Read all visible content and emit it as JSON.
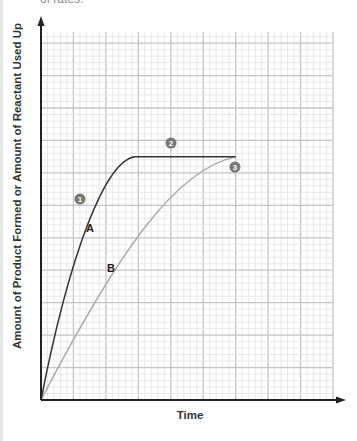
{
  "page": {
    "top_fragment": "of rates."
  },
  "chart_data": {
    "type": "line",
    "title": "",
    "xlabel": "Time",
    "ylabel": "Amount of Product Formed or Amount of Reactant Used Up",
    "grid": true,
    "x_range": [
      0,
      9
    ],
    "y_range": [
      0,
      11.5
    ],
    "series": [
      {
        "name": "A",
        "color": "#333333",
        "points": [
          [
            0,
            0
          ],
          [
            1,
            3.6
          ],
          [
            2,
            6.4
          ],
          [
            3,
            7.5
          ],
          [
            6,
            7.5
          ]
        ]
      },
      {
        "name": "B",
        "color": "#aaaaaa",
        "points": [
          [
            0,
            0
          ],
          [
            2,
            4.1
          ],
          [
            4,
            6.7
          ],
          [
            6,
            7.5
          ]
        ]
      }
    ],
    "annotations": [
      {
        "label": "1",
        "note": "steep initial slope of A"
      },
      {
        "label": "2",
        "note": "plateau of A"
      },
      {
        "label": "3",
        "note": "B reaches plateau"
      }
    ],
    "curve_labels": [
      "A",
      "B"
    ]
  }
}
